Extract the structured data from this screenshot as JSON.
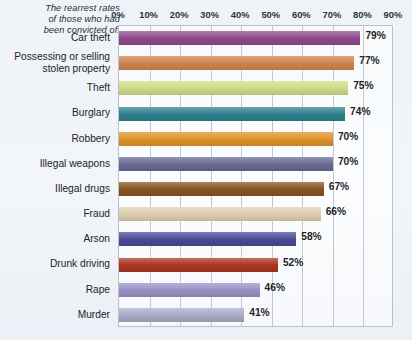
{
  "title": {
    "lines": [
      "The rearrest rates",
      "of those who had",
      "been convicted of:"
    ]
  },
  "chart_data": {
    "type": "bar",
    "orientation": "horizontal",
    "xlabel": "",
    "ylabel": "",
    "xlim": [
      0,
      90
    ],
    "grid": true,
    "legend": false,
    "tick_labels": [
      "0%",
      "10%",
      "20%",
      "30%",
      "40%",
      "50%",
      "60%",
      "70%",
      "80%",
      "90%"
    ],
    "tick_values": [
      0,
      10,
      20,
      30,
      40,
      50,
      60,
      70,
      80,
      90
    ],
    "categories": [
      "Car theft",
      "Possessing or selling\nstolen property",
      "Theft",
      "Burglary",
      "Robbery",
      "Illegal weapons",
      "Illegal drugs",
      "Fraud",
      "Arson",
      "Drunk driving",
      "Rape",
      "Murder"
    ],
    "values": [
      79,
      77,
      75,
      74,
      70,
      70,
      67,
      66,
      58,
      52,
      46,
      41
    ],
    "value_labels": [
      "79%",
      "77%",
      "75%",
      "74%",
      "70%",
      "70%",
      "67%",
      "66%",
      "58%",
      "52%",
      "46%",
      "41%"
    ],
    "colors": [
      "#8e4b8c",
      "#d1854f",
      "#cfdc8a",
      "#2e8290",
      "#e09329",
      "#6b6b96",
      "#8a5520",
      "#e0d0b0",
      "#4b4b99",
      "#ab3622",
      "#9b93c8",
      "#a9adc9"
    ]
  },
  "palette": {
    "background": "#eef2f7",
    "plot_background": "#fbfcfe",
    "gridline": "#c3c8d2",
    "border": "#b9bfcb",
    "text": "#222229"
  }
}
